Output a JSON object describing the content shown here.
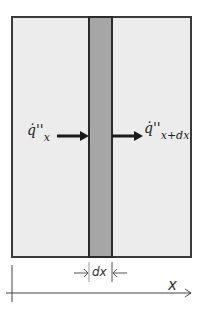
{
  "diagram": {
    "title": "",
    "flux_in": {
      "symbol": "q̇''",
      "subscript": "x"
    },
    "flux_out": {
      "symbol": "q̇''",
      "subscript": "x+dx"
    },
    "element_width_label": "dx",
    "axis_label": "x",
    "colors": {
      "wall_fill": "#ececec",
      "element_fill": "#a6a6a6",
      "outline": "#2a2a2a"
    }
  }
}
